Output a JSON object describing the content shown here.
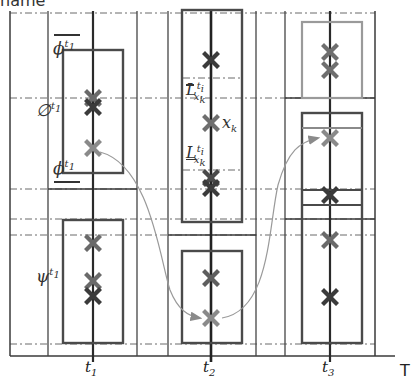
{
  "title_fragment": "name",
  "axis": {
    "label": "T",
    "ticks": [
      {
        "id": "t1",
        "label": "t",
        "sub": "1",
        "x": 93
      },
      {
        "id": "t2",
        "label": "t",
        "sub": "2",
        "x": 211
      },
      {
        "id": "t3",
        "label": "t",
        "sub": "3",
        "x": 330
      }
    ]
  },
  "labels": {
    "phi_upper": {
      "base": "ϕ",
      "sup": "t",
      "supsub": "1"
    },
    "empty_set": {
      "base": "∅",
      "sup": "t",
      "supsub": "1"
    },
    "phi_lower": {
      "base": "ϕ",
      "sup": "t",
      "supsub": "1"
    },
    "psi": {
      "base": "ψ",
      "sup": "t",
      "supsub": "1"
    },
    "L_upper": {
      "base": "L",
      "sub": "x",
      "subsub": "k",
      "sup": "t",
      "supsub": "i"
    },
    "x_k": {
      "base": "x",
      "sub": "k"
    },
    "L_lower": {
      "base": "L",
      "sub": "x",
      "subsub": "k",
      "sup": "t",
      "supsub": "i"
    }
  },
  "colors": {
    "frame": "#3a3a3a",
    "dashdot": "#555555",
    "box_dark": "#4a4a4a",
    "box_light": "#9a9a9a",
    "cross_dark": "#3b3b3b",
    "cross_mid": "#6e6e6e",
    "cross_light": "#8a8a8a",
    "arrow": "#9a9a9a"
  },
  "markers": [
    {
      "column": "t1",
      "y": 98,
      "tone": "mid"
    },
    {
      "column": "t1",
      "y": 107,
      "tone": "dark"
    },
    {
      "column": "t1",
      "y": 148,
      "tone": "light"
    },
    {
      "column": "t1",
      "y": 243,
      "tone": "mid"
    },
    {
      "column": "t1",
      "y": 281,
      "tone": "mid"
    },
    {
      "column": "t1",
      "y": 296,
      "tone": "dark"
    },
    {
      "column": "t2",
      "y": 60,
      "tone": "dark"
    },
    {
      "column": "t2",
      "y": 123,
      "tone": "mid"
    },
    {
      "column": "t2",
      "y": 183,
      "tone": "dark"
    },
    {
      "column": "t2",
      "y": 278,
      "tone": "mid"
    },
    {
      "column": "t2",
      "y": 318,
      "tone": "light"
    },
    {
      "column": "t3",
      "y": 52,
      "tone": "mid"
    },
    {
      "column": "t3",
      "y": 70,
      "tone": "mid"
    },
    {
      "column": "t3",
      "y": 138,
      "tone": "light"
    },
    {
      "column": "t3",
      "y": 195,
      "tone": "dark"
    },
    {
      "column": "t3",
      "y": 240,
      "tone": "mid"
    },
    {
      "column": "t3",
      "y": 297,
      "tone": "dark"
    }
  ],
  "transitions": [
    {
      "from": "t1 x=93 y=148",
      "to": "t2 x=211 y=318"
    },
    {
      "from": "t2 x=211 y=318",
      "to": "t3 x=330 y=138"
    }
  ]
}
